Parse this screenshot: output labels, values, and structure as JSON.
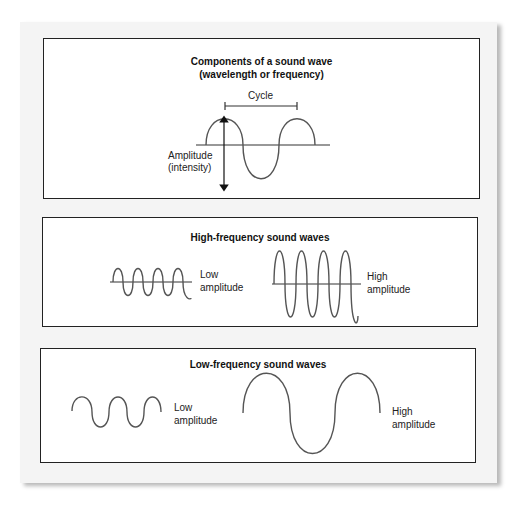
{
  "panels": {
    "components": {
      "title_line1": "Components of a sound wave",
      "title_line2": "(wavelength or frequency)",
      "cycle_label": "Cycle",
      "amplitude_label_line1": "Amplitude",
      "amplitude_label_line2": "(intensity)"
    },
    "high_frequency": {
      "title": "High-frequency sound waves",
      "low_label_line1": "Low",
      "low_label_line2": "amplitude",
      "high_label_line1": "High",
      "high_label_line2": "amplitude"
    },
    "low_frequency": {
      "title": "Low-frequency sound waves",
      "low_label_line1": "Low",
      "low_label_line2": "amplitude",
      "high_label_line1": "High",
      "high_label_line2": "amplitude"
    }
  },
  "colors": {
    "wave_stroke": "#555555",
    "border": "#222222",
    "paper": "#f4f4f4",
    "panel_bg": "#ffffff"
  }
}
